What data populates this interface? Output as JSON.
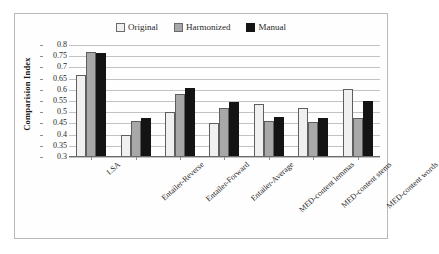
{
  "figure": {
    "border_color": "#b9b9b9",
    "background": "#ffffff"
  },
  "legend": {
    "position": "top-center",
    "entries": [
      {
        "label": "Original",
        "color": "#f0f0f0"
      },
      {
        "label": "Harmonized",
        "color": "#a8a8a8"
      },
      {
        "label": "Manual",
        "color": "#141414"
      }
    ]
  },
  "axes": {
    "ylabel": "Comparision Index",
    "xlabel": "",
    "yticks": [
      "0.8",
      "0.75",
      "0.7",
      "0.65",
      "0.6",
      "0.55",
      "0.5",
      "0.45",
      "0.4",
      "0.35",
      "0.3"
    ],
    "grid": true
  },
  "chart_data": {
    "type": "bar",
    "title": "",
    "xlabel": "",
    "ylabel": "Comparision Index",
    "ylim": [
      0.3,
      0.8
    ],
    "ytick_step": 0.05,
    "grid": true,
    "legend_position": "top-center",
    "categories": [
      "LSA",
      "Entailer-Reverse",
      "Entailer-Forward",
      "Entailer-Average",
      "MED-content lemmas",
      "MED-content stems",
      "MED-content words"
    ],
    "series": [
      {
        "name": "Original",
        "color": "#f0f0f0",
        "values": [
          0.665,
          0.4,
          0.5,
          0.45,
          0.535,
          0.52,
          0.605
        ]
      },
      {
        "name": "Harmonized",
        "color": "#a8a8a8",
        "values": [
          0.77,
          0.46,
          0.58,
          0.52,
          0.46,
          0.455,
          0.475
        ]
      },
      {
        "name": "Manual",
        "color": "#141414",
        "values": [
          0.765,
          0.475,
          0.61,
          0.545,
          0.48,
          0.475,
          0.55
        ]
      }
    ]
  }
}
